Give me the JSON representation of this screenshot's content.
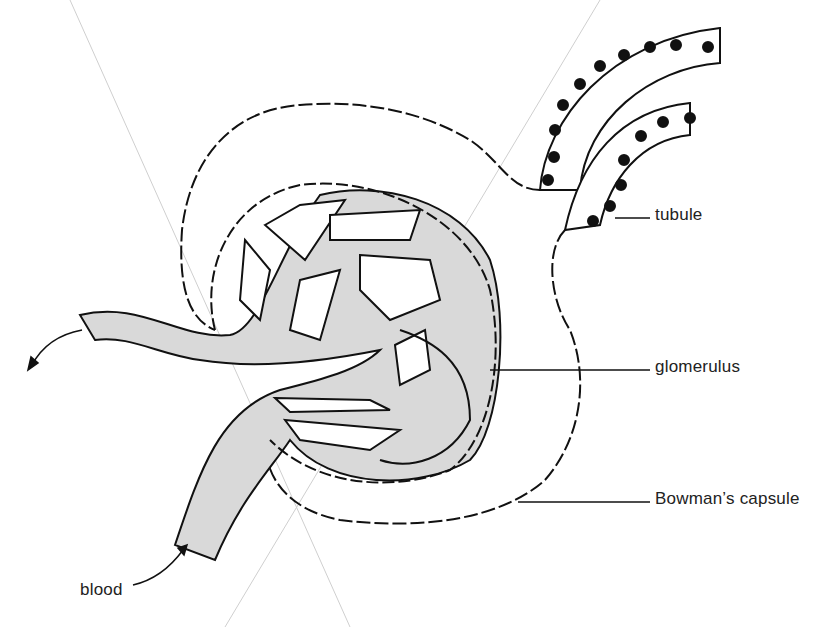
{
  "diagram": {
    "labels": {
      "tubule": "tubule",
      "glomerulus": "glomerulus",
      "bowmans_capsule": "Bowman’s capsule",
      "blood": "blood"
    },
    "colors": {
      "vessel_fill": "#d9d9d9",
      "outline": "#111111",
      "background": "#ffffff",
      "guide_lines": "#c8c8c8"
    },
    "arrows": [
      "blood-in-arrow",
      "blood-out-arrow"
    ]
  }
}
